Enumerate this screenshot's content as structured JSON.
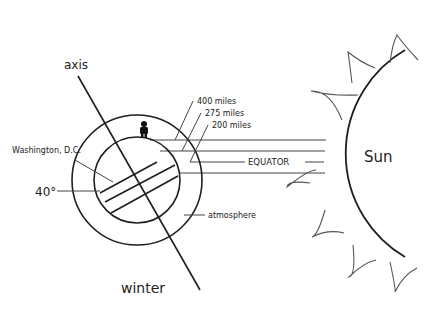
{
  "diagram": {
    "labels": {
      "axis": "axis",
      "winter": "winter",
      "washington": "Washington, D.C.",
      "latitude": "40°",
      "atmosphere": "atmosphere",
      "equator": "EQUATOR",
      "sun": "Sun",
      "dist_400": "400 miles",
      "dist_275": "275 miles",
      "dist_200": "200 miles"
    },
    "icons": {
      "person": "person-icon"
    },
    "colors": {
      "line": "#1e1e1e",
      "ray": "#555555",
      "background": "#ffffff"
    }
  }
}
